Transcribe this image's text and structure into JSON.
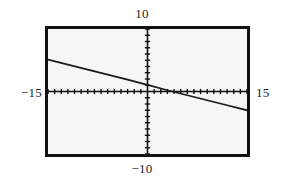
{
  "figure": {
    "name": "graphing-calculator-viewport",
    "background_color": "#ffffff",
    "screen_background_color": "#f6f6f5",
    "frame_color": "#111111"
  },
  "labels": {
    "top": "10",
    "bottom": "−10",
    "left": "−15",
    "right": "15"
  },
  "chart_data": {
    "type": "line",
    "title": "",
    "xlabel": "",
    "ylabel": "",
    "xlim": [
      -15,
      15
    ],
    "ylim": [
      -10,
      10
    ],
    "grid": false,
    "legend": null,
    "axes": {
      "x_axis_visible": true,
      "y_axis_visible": true,
      "x_tick_spacing": 1,
      "y_tick_spacing": 1,
      "tick_style": "dashes-on-axis"
    },
    "tick_labels": {
      "x": [
        "-15",
        "15"
      ],
      "y": [
        "-10",
        "10"
      ]
    },
    "series": [
      {
        "name": "line",
        "style": "solid",
        "color": "#1a1a1a",
        "x": [
          -15,
          -12,
          -9,
          -6,
          -3,
          0,
          3,
          6,
          9,
          12,
          15
        ],
        "y": [
          5.1,
          4.3,
          3.5,
          2.7,
          1.9,
          1.05,
          0.2,
          -0.6,
          -1.4,
          -2.2,
          -3.0
        ],
        "slope": -0.27,
        "intercept": 1.05,
        "endpoints": [
          {
            "x": -15,
            "y": 5.1
          },
          {
            "x": 15,
            "y": -3.0
          }
        ],
        "x_intercept": 3.9,
        "y_intercept": 1.05
      }
    ]
  }
}
